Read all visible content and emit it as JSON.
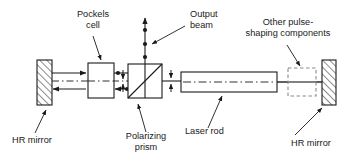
{
  "figure": {
    "type": "optical-schematic",
    "background_color": "#ffffff",
    "line_color": "#1a1a1a",
    "labels": {
      "pockels_cell_line1": "Pockels",
      "pockels_cell_line2": "cell",
      "output_beam_line1": "Output",
      "output_beam_line2": "beam",
      "other_components_line1": "Other pulse-",
      "other_components_line2": "shaping components",
      "hr_mirror_left": "HR mirror",
      "polarizing_prism_line1": "Polarizing",
      "polarizing_prism_line2": "prism",
      "laser_rod": "Laser rod",
      "hr_mirror_right": "HR mirror"
    },
    "components": [
      {
        "name": "hr-mirror-left",
        "style": "hatched-rectangle",
        "x": 37,
        "y": 60,
        "w": 15,
        "h": 45
      },
      {
        "name": "pockels-cell",
        "style": "solid-rectangle",
        "x": 88,
        "y": 63,
        "w": 26,
        "h": 35
      },
      {
        "name": "polarizing-prism",
        "style": "square-with-diagonal",
        "x": 128,
        "y": 64,
        "w": 34,
        "h": 34
      },
      {
        "name": "laser-rod",
        "style": "solid-rectangle-with-centerline",
        "x": 181,
        "y": 72,
        "w": 96,
        "h": 20
      },
      {
        "name": "other-pulse-shaping-components",
        "style": "dashed-square",
        "x": 288,
        "y": 68,
        "w": 28,
        "h": 28
      },
      {
        "name": "hr-mirror-right",
        "style": "hatched-rectangle",
        "x": 322,
        "y": 60,
        "w": 14,
        "h": 45
      }
    ],
    "beams": [
      {
        "name": "forward-beam",
        "direction": "right",
        "y": 73
      },
      {
        "name": "return-beam",
        "direction": "left",
        "y": 89
      },
      {
        "name": "cavity-axis",
        "direction": "horizontal",
        "y": 81,
        "style": "dash-dot"
      },
      {
        "name": "output-beam",
        "direction": "up",
        "x": 145
      }
    ]
  }
}
